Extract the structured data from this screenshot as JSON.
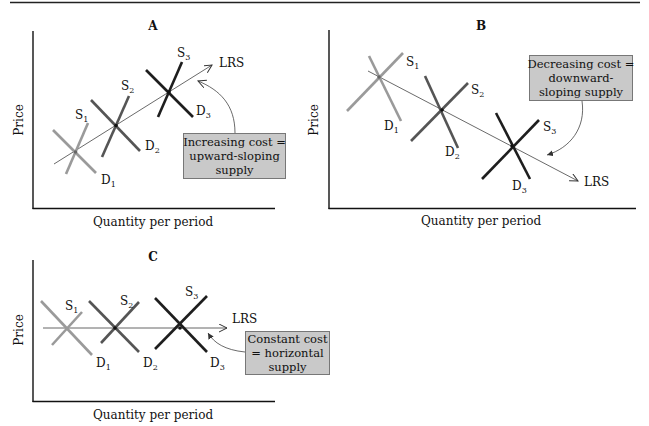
{
  "figure": {
    "panels": [
      {
        "id": "A",
        "title": "A",
        "ylabel": "Price",
        "xlabel": "Quantity per period",
        "lrs_label": "LRS",
        "callout": [
          "Increasing cost =",
          "upward-sloping",
          "supply"
        ],
        "supply_labels": [
          "S1",
          "S2",
          "S3"
        ],
        "demand_labels": [
          "D1",
          "D2",
          "D3"
        ]
      },
      {
        "id": "B",
        "title": "B",
        "ylabel": "Price",
        "xlabel": "Quantity per period",
        "lrs_label": "LRS",
        "callout": [
          "Decreasing cost =",
          "downward-",
          "sloping supply"
        ],
        "supply_labels": [
          "S1",
          "S2",
          "S3"
        ],
        "demand_labels": [
          "D1",
          "D2",
          "D3"
        ]
      },
      {
        "id": "C",
        "title": "C",
        "ylabel": "Price",
        "xlabel": "Quantity per period",
        "lrs_label": "LRS",
        "callout": [
          "Constant cost",
          "= horizontal",
          "supply"
        ],
        "supply_labels": [
          "S1",
          "S2",
          "S3"
        ],
        "demand_labels": [
          "D1",
          "D2",
          "D3"
        ]
      }
    ],
    "colors": {
      "curve_1": "#9a9a9a",
      "curve_2": "#555555",
      "curve_3": "#1e1e1e",
      "callout_fill": "#c9c9c9",
      "axis": "#111111"
    }
  }
}
